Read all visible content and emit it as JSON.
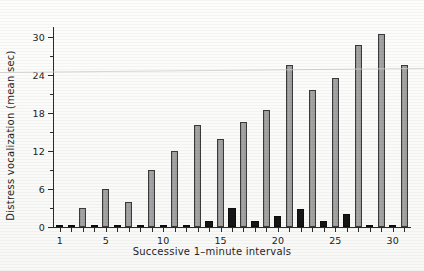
{
  "chart_data": {
    "type": "bar",
    "title": "",
    "xlabel": "Successive 1–minute intervals",
    "ylabel": "Distress vocalization (mean sec)",
    "ylim": [
      0,
      31.5
    ],
    "xlim": [
      0.4,
      31.6
    ],
    "grid": false,
    "legend": null,
    "y_ticks_major": [
      0,
      6,
      12,
      18,
      24,
      30
    ],
    "y_ticks_minor": [
      3,
      9,
      15,
      21,
      27
    ],
    "y_tick_labels": [
      "0",
      "6",
      "12",
      "18",
      "24",
      "30"
    ],
    "x_tick_labels": [
      "1",
      "5",
      "10",
      "15",
      "20",
      "25",
      "30"
    ],
    "x_tick_label_positions": [
      1,
      5,
      10,
      15,
      20,
      25,
      30
    ],
    "categories": [
      1,
      2,
      3,
      4,
      5,
      6,
      7,
      8,
      9,
      10,
      11,
      12,
      13,
      14,
      15,
      16,
      17,
      18,
      19,
      20,
      21,
      22,
      23,
      24,
      25,
      26,
      27,
      28,
      29,
      30,
      31
    ],
    "values": [
      0.15,
      0.15,
      3.0,
      0.15,
      6.0,
      0.15,
      4.0,
      0.15,
      9.0,
      0.15,
      11.9,
      0.15,
      16.0,
      0.9,
      13.8,
      3.0,
      16.5,
      0.9,
      18.5,
      1.7,
      25.5,
      2.8,
      21.6,
      0.9,
      23.4,
      2.0,
      28.7,
      0.1,
      30.4,
      0.1,
      25.5
    ],
    "bar_colors": [
      "dark",
      "dark",
      "gray",
      "dark",
      "gray",
      "dark",
      "gray",
      "dark",
      "gray",
      "dark",
      "gray",
      "dark",
      "gray",
      "dark",
      "gray",
      "dark",
      "gray",
      "dark",
      "gray",
      "dark",
      "gray",
      "dark",
      "gray",
      "dark",
      "gray",
      "dark",
      "gray",
      "dark",
      "gray",
      "dark",
      "gray"
    ],
    "series": [
      {
        "name": "gray-bars",
        "color": "#9d9d9d",
        "points": [
          {
            "x": 3,
            "y": 3.0
          },
          {
            "x": 5,
            "y": 6.0
          },
          {
            "x": 7,
            "y": 4.0
          },
          {
            "x": 9,
            "y": 9.0
          },
          {
            "x": 11,
            "y": 11.9
          },
          {
            "x": 13,
            "y": 16.0
          },
          {
            "x": 15,
            "y": 13.8
          },
          {
            "x": 17,
            "y": 16.5
          },
          {
            "x": 19,
            "y": 18.5
          },
          {
            "x": 21,
            "y": 25.5
          },
          {
            "x": 23,
            "y": 21.6
          },
          {
            "x": 25,
            "y": 23.4
          },
          {
            "x": 27,
            "y": 28.7
          },
          {
            "x": 29,
            "y": 30.4
          },
          {
            "x": 31,
            "y": 25.5
          }
        ]
      },
      {
        "name": "dark-bars",
        "color": "#161616",
        "points": [
          {
            "x": 1,
            "y": 0.15
          },
          {
            "x": 2,
            "y": 0.15
          },
          {
            "x": 4,
            "y": 0.15
          },
          {
            "x": 6,
            "y": 0.15
          },
          {
            "x": 8,
            "y": 0.15
          },
          {
            "x": 10,
            "y": 0.15
          },
          {
            "x": 12,
            "y": 0.15
          },
          {
            "x": 14,
            "y": 0.9
          },
          {
            "x": 16,
            "y": 3.0
          },
          {
            "x": 18,
            "y": 0.9
          },
          {
            "x": 20,
            "y": 1.7
          },
          {
            "x": 22,
            "y": 2.8
          },
          {
            "x": 24,
            "y": 0.9
          },
          {
            "x": 26,
            "y": 2.0
          },
          {
            "x": 28,
            "y": 0.1
          },
          {
            "x": 30,
            "y": 0.1
          }
        ]
      }
    ]
  },
  "colors": {
    "bar_gray": "#9d9d9d",
    "bar_dark": "#161616",
    "axis": "#2b2b2b",
    "paper": "#fbfbfa",
    "scan_artifact": "#cfcfcf"
  }
}
